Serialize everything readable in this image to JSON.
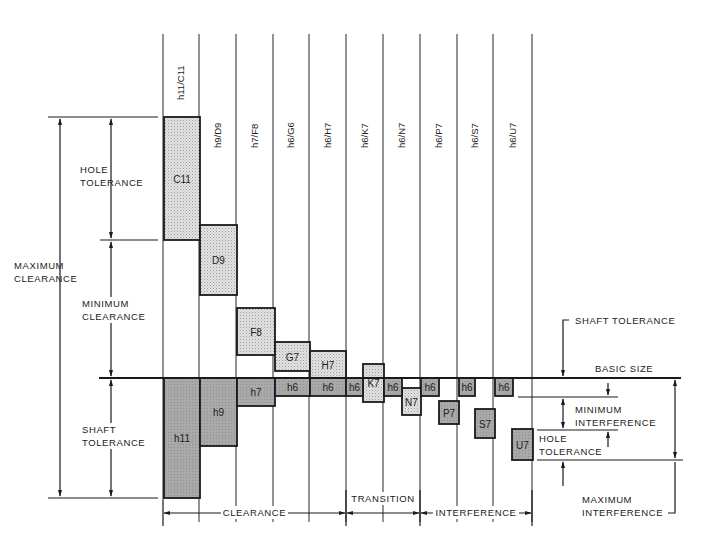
{
  "colors": {
    "line": "#1a1a1a",
    "hole_fill": "#d9d9d9",
    "shaft_fill": "#a8a8a8",
    "dark_shaft_fill": "#9a9a9a",
    "background": "#ffffff"
  },
  "columns": [
    {
      "fit": "h11/C11",
      "x": 163
    },
    {
      "fit": "h9/D9",
      "x": 199
    },
    {
      "fit": "h7/F8",
      "x": 236
    },
    {
      "fit": "h6/G6",
      "x": 273
    },
    {
      "fit": "h6/H7",
      "x": 309
    },
    {
      "fit": "h6/K7",
      "x": 346
    },
    {
      "fit": "h6/N7",
      "x": 383
    },
    {
      "fit": "h6/P7",
      "x": 420
    },
    {
      "fit": "h6/S7",
      "x": 457
    },
    {
      "fit": "h6/U7",
      "x": 493
    },
    {
      "fit": "",
      "x": 532
    }
  ],
  "basic_size": {
    "label": "BASIC SIZE",
    "y": 378
  },
  "hole_blocks": [
    {
      "label": "C11",
      "x1": 164,
      "x2": 200,
      "y1": 117,
      "y2": 240
    },
    {
      "label": "D9",
      "x1": 200,
      "x2": 237,
      "y1": 225,
      "y2": 295
    },
    {
      "label": "F8",
      "x1": 237,
      "x2": 275,
      "y1": 308,
      "y2": 355
    },
    {
      "label": "G7",
      "x1": 275,
      "x2": 310,
      "y1": 342,
      "y2": 371
    },
    {
      "label": "H7",
      "x1": 310,
      "x2": 346,
      "y1": 351,
      "y2": 378
    },
    {
      "label": "K7",
      "x1": 363,
      "x2": 384,
      "y1": 364,
      "y2": 402
    },
    {
      "label": "N7",
      "x1": 402,
      "x2": 421,
      "y1": 388,
      "y2": 415
    },
    {
      "label": "P7",
      "x1": 439,
      "x2": 459,
      "y1": 401,
      "y2": 424
    },
    {
      "label": "S7",
      "x1": 475,
      "x2": 495,
      "y1": 409,
      "y2": 438
    },
    {
      "label": "U7",
      "x1": 512,
      "x2": 533,
      "y1": 429,
      "y2": 460
    }
  ],
  "shaft_blocks": [
    {
      "label": "h11",
      "x1": 164,
      "x2": 200,
      "y1": 378,
      "y2": 498
    },
    {
      "label": "h9",
      "x1": 200,
      "x2": 237,
      "y1": 378,
      "y2": 446
    },
    {
      "label": "h7",
      "x1": 237,
      "x2": 275,
      "y1": 378,
      "y2": 406
    },
    {
      "label": "h6",
      "x1": 275,
      "x2": 310,
      "y1": 378,
      "y2": 396
    },
    {
      "label": "h6",
      "x1": 310,
      "x2": 346,
      "y1": 378,
      "y2": 396
    },
    {
      "label": "h6",
      "x1": 346,
      "x2": 363,
      "y1": 378,
      "y2": 396
    },
    {
      "label": "h6",
      "x1": 384,
      "x2": 402,
      "y1": 378,
      "y2": 396
    },
    {
      "label": "h6",
      "x1": 421,
      "x2": 439,
      "y1": 378,
      "y2": 396
    },
    {
      "label": "h6",
      "x1": 459,
      "x2": 475,
      "y1": 378,
      "y2": 396
    },
    {
      "label": "h6",
      "x1": 495,
      "x2": 513,
      "y1": 378,
      "y2": 396
    }
  ],
  "left_annotations": {
    "maximum_clearance": [
      "MAXIMUM",
      "CLEARANCE"
    ],
    "hole_tolerance": [
      "HOLE",
      "TOLERANCE"
    ],
    "minimum_clearance": [
      "MINIMUM",
      "CLEARANCE"
    ],
    "shaft_tolerance": [
      "SHAFT",
      "TOLERANCE"
    ]
  },
  "right_annotations": {
    "shaft_tolerance": "SHAFT TOLERANCE",
    "minimum_interference": [
      "MINIMUM",
      "INTERFERENCE"
    ],
    "hole_tolerance": [
      "HOLE",
      "TOLERANCE"
    ],
    "maximum_interference": [
      "MAXIMUM",
      "INTERFERENCE"
    ]
  },
  "bottom_ranges": [
    {
      "label": "CLEARANCE",
      "x1": 163,
      "x2": 346
    },
    {
      "label": "TRANSITION",
      "x1": 346,
      "x2": 420
    },
    {
      "label": "INTERFERENCE",
      "x1": 420,
      "x2": 532
    }
  ]
}
